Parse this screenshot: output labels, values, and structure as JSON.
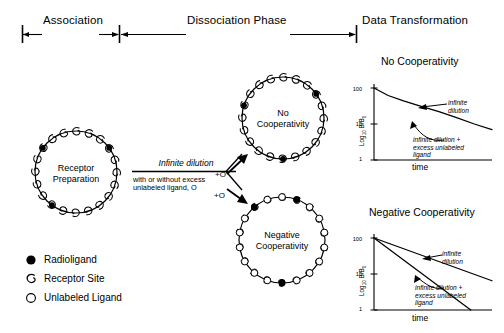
{
  "header": {
    "phases": [
      {
        "label": "Association"
      },
      {
        "label": "Dissociation Phase"
      },
      {
        "label": "Data Transformation"
      }
    ]
  },
  "diagram": {
    "receptor_preparation": {
      "label_line1": "Receptor",
      "label_line2": "Preparation",
      "receptor_sites": 20,
      "radioligand_bound": 3
    },
    "arrow": {
      "title": "Infinite dilution",
      "sub_line1": "with or without excess",
      "sub_line2": "unlabeled ligand, O",
      "branch_label_top": "+O",
      "branch_label_bottom": "+O"
    },
    "no_cooperativity_circle": {
      "label_line1": "No",
      "label_line2": "Cooperativity",
      "receptor_sites": 20,
      "radioligand_bound": 3
    },
    "negative_cooperativity_circle": {
      "label_line1": "Negative",
      "label_line2": "Cooperativity",
      "receptor_sites": 18,
      "radioligand_bound": 3,
      "unlabeled_bound": 15
    }
  },
  "legend": {
    "items": [
      {
        "glyph": "filled-circle-icon",
        "label": "Radioligand"
      },
      {
        "glyph": "receptor-hook-icon",
        "label": "Receptor Site"
      },
      {
        "glyph": "open-circle-icon",
        "label": "Unlabeled Ligand"
      }
    ]
  },
  "chart_data": [
    {
      "type": "line",
      "title": "No Cooperativity",
      "xlabel": "time",
      "ylabel": "Log10 B/B0",
      "ylabel_parts": {
        "base": "Log",
        "sub1": "10",
        "mid": " B/B",
        "sub2": "0"
      },
      "yticks": [
        "100",
        "10",
        "1"
      ],
      "ylim": [
        1,
        100
      ],
      "yscale": "log",
      "grid": false,
      "xticks": [],
      "series": [
        {
          "name": "infinite dilution",
          "points": [
            [
              0,
              100
            ],
            [
              0.12,
              62
            ],
            [
              0.25,
              44
            ],
            [
              0.4,
              31
            ],
            [
              0.55,
              22
            ],
            [
              0.7,
              15
            ],
            [
              0.85,
              10
            ],
            [
              1.0,
              7
            ]
          ]
        }
      ],
      "annotations": [
        {
          "text_line1": "infinite",
          "text_line2": "dilution",
          "italic": true
        },
        {
          "text_line1": "infinite dilution +",
          "text_line2": "excess unlabeled",
          "text_line3": "ligand",
          "italic": true
        }
      ]
    },
    {
      "type": "line",
      "title": "Negative Cooperativity",
      "xlabel": "time",
      "ylabel": "Log10 B/B0",
      "ylabel_parts": {
        "base": "Log",
        "sub1": "10",
        "mid": " B/B",
        "sub2": "0"
      },
      "yticks": [
        "100",
        "10",
        "1"
      ],
      "ylim": [
        1,
        100
      ],
      "yscale": "log",
      "grid": false,
      "xticks": [],
      "series": [
        {
          "name": "infinite dilution",
          "points": [
            [
              0,
              100
            ],
            [
              1.0,
              6.5
            ]
          ]
        },
        {
          "name": "infinite dilution + excess unlabeled ligand",
          "points": [
            [
              0,
              100
            ],
            [
              0.82,
              1.0
            ]
          ]
        }
      ],
      "annotations": [
        {
          "text_line1": "infinite",
          "text_line2": "dilution",
          "italic": true
        },
        {
          "text_line1": "infinite dilution +",
          "text_line2": "excess unlabeled",
          "text_line3": "ligand",
          "italic": true
        }
      ]
    }
  ]
}
